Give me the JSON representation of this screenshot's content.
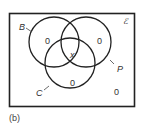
{
  "diagram": {
    "type": "venn",
    "universal_label": "ℰ",
    "sets": [
      {
        "name": "B",
        "label": "B"
      },
      {
        "name": "P",
        "label": "P"
      },
      {
        "name": "C",
        "label": "C"
      }
    ],
    "regions": {
      "B_only": "0",
      "P_only": "0",
      "C_only": "0",
      "B_P_C": "x",
      "outside": "0"
    },
    "caption": "(b)",
    "colors": {
      "stroke": "#222222",
      "background": "#ffffff"
    }
  }
}
